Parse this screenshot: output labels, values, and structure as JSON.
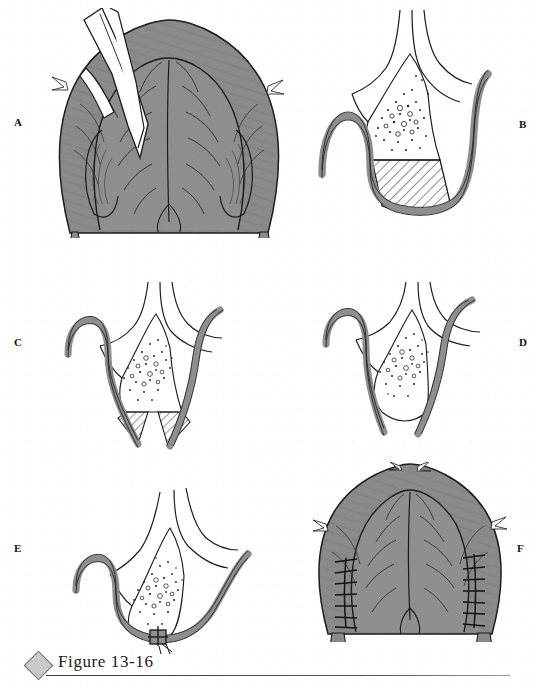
{
  "figure": {
    "caption": "Figure 13-16",
    "diamond_color": "#c9c9c9",
    "rule_color": "#3a3a3a"
  },
  "palette": {
    "tissue_gray": "#8a8a8a",
    "tissue_gray_dark": "#6f6f6f",
    "mucosa_band_gray": "#8e8e8e",
    "outline": "#1a1a1a",
    "hatch_line": "#2b2b2b",
    "stipple": "#1f1f1f",
    "paper": "#ffffff"
  },
  "panels": [
    {
      "id": "A",
      "label": "A",
      "label_x": 14,
      "label_y": 117,
      "view": "intraoral-occlusal-view",
      "description": "Occlusal view of the palate with a scalpel held in the upper left making the incision along the cleft margin",
      "elements": [
        "palate-outline",
        "cleft-margin",
        "scalpel-instrument",
        "alveolar-ridge",
        "uvula-notch"
      ]
    },
    {
      "id": "B",
      "label": "B",
      "label_x": 519,
      "label_y": 119,
      "view": "coronal-cross-section",
      "description": "Cross section showing the stippled bone/glandular layer and the cross-hatched wedge of tissue to be excised, bounded by the gray mucoperiosteal band",
      "elements": [
        "mucosa-band",
        "stipple-region",
        "hatched-wedge",
        "nasal-cavity-outline"
      ]
    },
    {
      "id": "C",
      "label": "C",
      "label_x": 14,
      "label_y": 337,
      "view": "coronal-cross-section",
      "description": "Cross section after partial elevation; the gray band drops free and small hatched remnants remain at the flap edges",
      "elements": [
        "mucosa-band",
        "stipple-region",
        "hatch-remnant-left",
        "hatch-remnant-right"
      ]
    },
    {
      "id": "D",
      "label": "D",
      "label_x": 519,
      "label_y": 337,
      "view": "coronal-cross-section",
      "description": "Cross section with the wedge removed and the flap edges mobilized toward the midline",
      "elements": [
        "mucosa-band",
        "stipple-region",
        "mobilized-flap-edges"
      ]
    },
    {
      "id": "E",
      "label": "E",
      "label_x": 14,
      "label_y": 543,
      "view": "coronal-cross-section",
      "description": "Cross section of the completed closure with a single suture knot securing the midline",
      "elements": [
        "mucosa-band",
        "stipple-region",
        "suture-knot"
      ]
    },
    {
      "id": "F",
      "label": "F",
      "label_x": 517,
      "label_y": 543,
      "view": "intraoral-occlusal-view",
      "description": "Occlusal view of the repaired palate showing bilateral interrupted suture lines along the lateral releasing incisions",
      "elements": [
        "palate-outline",
        "suture-line-left",
        "suture-line-right",
        "midline-raphe"
      ]
    }
  ]
}
